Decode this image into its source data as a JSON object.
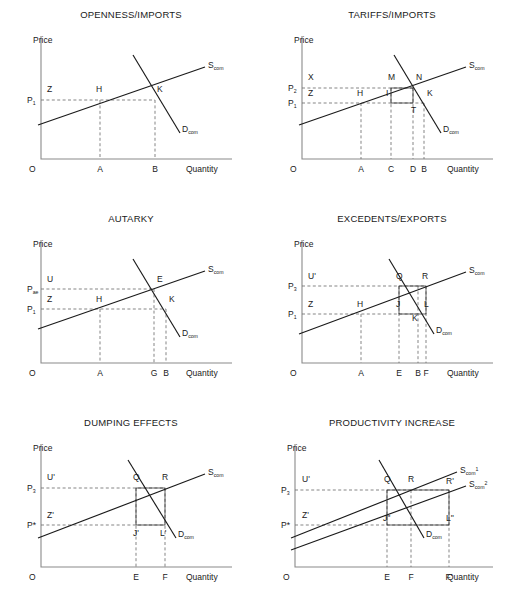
{
  "figure": {
    "background": "#ffffff",
    "ink": "#1a1a1a",
    "axis_color": "#8a8a8a",
    "dash_color": "#707070"
  },
  "axis_labels": {
    "price": "Price",
    "quantity": "Quantity",
    "origin": "O"
  },
  "curves": {
    "supply": "S",
    "supply_sub": "com",
    "demand": "D",
    "demand_sub": "com",
    "supply1_sup": "1",
    "supply2_sup": "2"
  },
  "panels": [
    {
      "id": "openness-imports",
      "title": "OPENNESS/IMPORTS",
      "price_ticks": [
        {
          "label": "P",
          "sub": "1",
          "sup": "",
          "y": 100
        }
      ],
      "x_ticks": [
        {
          "label": "A",
          "x": 100
        },
        {
          "label": "B",
          "x": 155
        }
      ],
      "points": [
        {
          "label": "Z",
          "x": 47,
          "y": 92
        },
        {
          "label": "H",
          "x": 96,
          "y": 92
        },
        {
          "label": "K",
          "x": 157,
          "y": 92
        }
      ],
      "supply_curves": [
        {
          "label_sup": "",
          "x1": 38,
          "y1": 125,
          "x2": 205,
          "y2": 67
        }
      ],
      "demand_curve": {
        "x1": 133,
        "y1": 55,
        "x2": 180,
        "y2": 133
      },
      "dashed": [
        {
          "type": "h",
          "y": 100,
          "x1": 41,
          "x2": 155
        },
        {
          "type": "v",
          "x": 100,
          "y1": 100,
          "y2": 159
        },
        {
          "type": "v",
          "x": 155,
          "y1": 100,
          "y2": 159
        }
      ],
      "hatch": null
    },
    {
      "id": "tariffs-imports",
      "title": "TARIFFS/IMPORTS",
      "price_ticks": [
        {
          "label": "P",
          "sub": "2",
          "sup": "",
          "y": 88
        },
        {
          "label": "P",
          "sub": "1",
          "sup": "",
          "y": 103
        }
      ],
      "x_ticks": [
        {
          "label": "A",
          "x": 100
        },
        {
          "label": "C",
          "x": 130
        },
        {
          "label": "D",
          "x": 152
        },
        {
          "label": "B",
          "x": 163
        }
      ],
      "points": [
        {
          "label": "X",
          "x": 47,
          "y": 80
        },
        {
          "label": "Z",
          "x": 47,
          "y": 96
        },
        {
          "label": "H",
          "x": 96,
          "y": 96
        },
        {
          "label": "M",
          "x": 127,
          "y": 80
        },
        {
          "label": "I",
          "x": 125,
          "y": 96
        },
        {
          "label": "N",
          "x": 155,
          "y": 80
        },
        {
          "label": "K",
          "x": 166,
          "y": 96
        },
        {
          "label": "T",
          "x": 150,
          "y": 113
        }
      ],
      "supply_curves": [
        {
          "label_sup": "",
          "x1": 38,
          "y1": 125,
          "x2": 205,
          "y2": 67
        }
      ],
      "demand_curve": {
        "x1": 133,
        "y1": 55,
        "x2": 180,
        "y2": 133
      },
      "dashed": [
        {
          "type": "h",
          "y": 88,
          "x1": 41,
          "x2": 152
        },
        {
          "type": "h",
          "y": 103,
          "x1": 41,
          "x2": 163
        },
        {
          "type": "v",
          "x": 100,
          "y1": 103,
          "y2": 159
        },
        {
          "type": "v",
          "x": 130,
          "y1": 88,
          "y2": 159
        },
        {
          "type": "v",
          "x": 152,
          "y1": 88,
          "y2": 159
        },
        {
          "type": "v",
          "x": 163,
          "y1": 103,
          "y2": 159
        }
      ],
      "hatch": {
        "x": 130,
        "y": 88,
        "w": 22,
        "h": 15
      }
    },
    {
      "id": "autarky",
      "title": "AUTARKY",
      "price_ticks": [
        {
          "label": "P",
          "sub": "ae",
          "sup": "",
          "y": 85
        },
        {
          "label": "P",
          "sub": "1",
          "sup": "",
          "y": 105
        }
      ],
      "x_ticks": [
        {
          "label": "A",
          "x": 100
        },
        {
          "label": "G",
          "x": 154
        },
        {
          "label": "B",
          "x": 166
        }
      ],
      "points": [
        {
          "label": "U",
          "x": 47,
          "y": 78
        },
        {
          "label": "Z",
          "x": 47,
          "y": 98
        },
        {
          "label": "H",
          "x": 96,
          "y": 98
        },
        {
          "label": "E",
          "x": 157,
          "y": 78
        },
        {
          "label": "K",
          "x": 169,
          "y": 98
        }
      ],
      "supply_curves": [
        {
          "label_sup": "",
          "x1": 38,
          "y1": 125,
          "x2": 205,
          "y2": 67
        }
      ],
      "demand_curve": {
        "x1": 133,
        "y1": 55,
        "x2": 180,
        "y2": 133
      },
      "dashed": [
        {
          "type": "h",
          "y": 85,
          "x1": 41,
          "x2": 154
        },
        {
          "type": "h",
          "y": 105,
          "x1": 41,
          "x2": 166
        },
        {
          "type": "v",
          "x": 100,
          "y1": 105,
          "y2": 159
        },
        {
          "type": "v",
          "x": 154,
          "y1": 85,
          "y2": 159
        },
        {
          "type": "v",
          "x": 166,
          "y1": 105,
          "y2": 159
        }
      ],
      "hatch": null
    },
    {
      "id": "excedents-exports",
      "title": "EXCEDENTS/EXPORTS",
      "price_ticks": [
        {
          "label": "P",
          "sub": "3",
          "sup": "",
          "y": 82
        },
        {
          "label": "P",
          "sub": "1",
          "sup": "",
          "y": 110
        }
      ],
      "x_ticks": [
        {
          "label": "A",
          "x": 100
        },
        {
          "label": "E",
          "x": 138
        },
        {
          "label": "B",
          "x": 157
        },
        {
          "label": "F",
          "x": 165
        }
      ],
      "points": [
        {
          "label": "U'",
          "x": 47,
          "y": 75
        },
        {
          "label": "Z",
          "x": 47,
          "y": 103
        },
        {
          "label": "H",
          "x": 96,
          "y": 103
        },
        {
          "label": "Q",
          "x": 135,
          "y": 75
        },
        {
          "label": "R",
          "x": 161,
          "y": 75
        },
        {
          "label": "J",
          "x": 135,
          "y": 103
        },
        {
          "label": "L",
          "x": 163,
          "y": 103
        },
        {
          "label": "K",
          "x": 151,
          "y": 117
        }
      ],
      "supply_curves": [
        {
          "label_sup": "",
          "x1": 38,
          "y1": 130,
          "x2": 205,
          "y2": 68
        }
      ],
      "demand_curve": {
        "x1": 128,
        "y1": 55,
        "x2": 173,
        "y2": 130
      },
      "dashed": [
        {
          "type": "h",
          "y": 82,
          "x1": 41,
          "x2": 165
        },
        {
          "type": "h",
          "y": 110,
          "x1": 41,
          "x2": 157
        },
        {
          "type": "v",
          "x": 100,
          "y1": 110,
          "y2": 159
        },
        {
          "type": "v",
          "x": 138,
          "y1": 82,
          "y2": 159
        },
        {
          "type": "v",
          "x": 157,
          "y1": 82,
          "y2": 159
        },
        {
          "type": "v",
          "x": 165,
          "y1": 82,
          "y2": 159
        }
      ],
      "hatch": {
        "x": 138,
        "y": 82,
        "w": 27,
        "h": 28
      }
    },
    {
      "id": "dumping-effects",
      "title": "DUMPING EFFECTS",
      "price_ticks": [
        {
          "label": "P",
          "sub": "3",
          "sup": "",
          "y": 80
        },
        {
          "label": "P*",
          "sub": "",
          "sup": "",
          "y": 117
        }
      ],
      "x_ticks": [
        {
          "label": "E",
          "x": 136
        },
        {
          "label": "F",
          "x": 165
        }
      ],
      "points": [
        {
          "label": "U'",
          "x": 47,
          "y": 72
        },
        {
          "label": "Z'",
          "x": 47,
          "y": 110
        },
        {
          "label": "Q",
          "x": 133,
          "y": 72
        },
        {
          "label": "R",
          "x": 162,
          "y": 72
        },
        {
          "label": "J'",
          "x": 133,
          "y": 128
        },
        {
          "label": "L'",
          "x": 160,
          "y": 128
        }
      ],
      "supply_curves": [
        {
          "label_sup": "",
          "x1": 38,
          "y1": 130,
          "x2": 205,
          "y2": 66
        }
      ],
      "demand_curve": {
        "x1": 128,
        "y1": 52,
        "x2": 176,
        "y2": 130
      },
      "dashed": [
        {
          "type": "h",
          "y": 80,
          "x1": 41,
          "x2": 165
        },
        {
          "type": "h",
          "y": 117,
          "x1": 41,
          "x2": 165
        },
        {
          "type": "v",
          "x": 136,
          "y1": 80,
          "y2": 159
        },
        {
          "type": "v",
          "x": 165,
          "y1": 80,
          "y2": 159
        }
      ],
      "hatch": {
        "x": 136,
        "y": 80,
        "w": 29,
        "h": 37
      }
    },
    {
      "id": "productivity-increase",
      "title": "PRODUCTIVITY INCREASE",
      "price_ticks": [
        {
          "label": "P",
          "sub": "3",
          "sup": "",
          "y": 82
        },
        {
          "label": "P*",
          "sub": "",
          "sup": "",
          "y": 117
        }
      ],
      "x_ticks": [
        {
          "label": "E",
          "x": 126
        },
        {
          "label": "F",
          "x": 150
        },
        {
          "label": "F'",
          "x": 188
        }
      ],
      "points": [
        {
          "label": "U'",
          "x": 41,
          "y": 74
        },
        {
          "label": "Z'",
          "x": 41,
          "y": 110
        },
        {
          "label": "Q",
          "x": 123,
          "y": 74
        },
        {
          "label": "R",
          "x": 147,
          "y": 74
        },
        {
          "label": "R'",
          "x": 185,
          "y": 76
        },
        {
          "label": "J''",
          "x": 122,
          "y": 113
        },
        {
          "label": "L''",
          "x": 185,
          "y": 113
        }
      ],
      "supply_curves": [
        {
          "label_sup": "1",
          "x1": 30,
          "y1": 130,
          "x2": 196,
          "y2": 64
        },
        {
          "label_sup": "2",
          "x1": 30,
          "y1": 142,
          "x2": 205,
          "y2": 78
        }
      ],
      "demand_curve": {
        "x1": 118,
        "y1": 52,
        "x2": 163,
        "y2": 130
      },
      "dashed": [
        {
          "type": "h",
          "y": 82,
          "x1": 34,
          "x2": 188
        },
        {
          "type": "h",
          "y": 117,
          "x1": 34,
          "x2": 188
        },
        {
          "type": "v",
          "x": 126,
          "y1": 82,
          "y2": 159
        },
        {
          "type": "v",
          "x": 150,
          "y1": 82,
          "y2": 159
        },
        {
          "type": "v",
          "x": 188,
          "y1": 82,
          "y2": 159
        }
      ],
      "hatch": {
        "x": 126,
        "y": 82,
        "w": 62,
        "h": 35
      }
    }
  ]
}
